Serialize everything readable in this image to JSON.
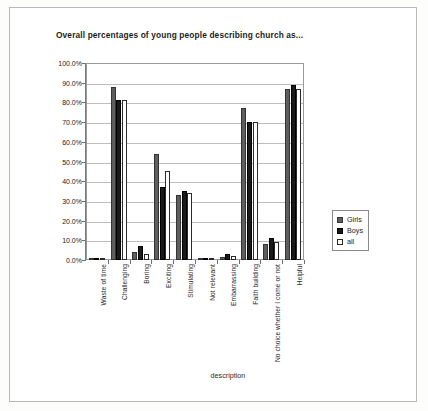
{
  "chart_data": {
    "type": "bar",
    "title": "Overall percentages of young people describing church as...",
    "xlabel": "description",
    "ylabel": "",
    "ylim": [
      0,
      100
    ],
    "ytick_labels": [
      "100.0%",
      "90.0%",
      "80.0%",
      "70.0%",
      "60.0%",
      "50.0%",
      "40.0%",
      "30.0%",
      "20.0%",
      "10.0%",
      "0.0%"
    ],
    "ytick_values": [
      100,
      90,
      80,
      70,
      60,
      50,
      40,
      30,
      20,
      10,
      0
    ],
    "grid": true,
    "legend_position": "right",
    "categories": [
      "Waste of time",
      "Challenging",
      "Boring",
      "Exciting",
      "Stimulating",
      "Not relevant",
      "Embarrassing",
      "Faith building",
      "No choice whether I come or not",
      "Helpful"
    ],
    "series": [
      {
        "name": "Girls",
        "color": "#5e5e5e",
        "values": [
          1.0,
          88.0,
          4.0,
          54.0,
          33.0,
          1.0,
          1.5,
          77.0,
          8.0,
          87.0
        ]
      },
      {
        "name": "Boys",
        "color": "#1a1a1a",
        "values": [
          1.0,
          81.0,
          7.0,
          37.0,
          35.0,
          1.0,
          3.0,
          70.0,
          11.0,
          89.0
        ]
      },
      {
        "name": "all",
        "color": "#ffffff",
        "values": [
          1.0,
          81.0,
          3.0,
          45.0,
          34.0,
          1.0,
          2.0,
          70.0,
          9.0,
          87.0
        ]
      }
    ]
  },
  "legend": {
    "items": [
      {
        "label": "Girls",
        "swatch": "girls"
      },
      {
        "label": "Boys",
        "swatch": "boys"
      },
      {
        "label": "all",
        "swatch": "all"
      }
    ]
  }
}
